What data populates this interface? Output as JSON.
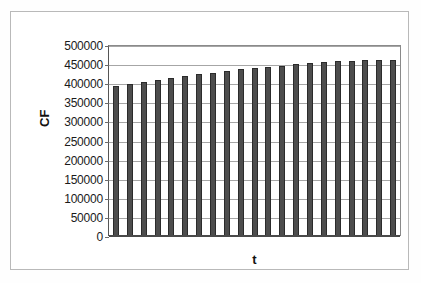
{
  "chart_data": {
    "type": "bar",
    "title": "",
    "xlabel": "t",
    "ylabel": "CF",
    "ylim": [
      0,
      500000
    ],
    "ytick_labels": [
      "500000",
      "450000",
      "400000",
      "350000",
      "300000",
      "250000",
      "200000",
      "150000",
      "100000",
      "50000",
      "0"
    ],
    "ytick_values": [
      500000,
      450000,
      400000,
      350000,
      300000,
      250000,
      200000,
      150000,
      100000,
      50000,
      0
    ],
    "xtick_labels": [],
    "grid": true,
    "legend": false,
    "bar_color": "#4d4d4d",
    "bar_edge_color": "#2b2b2b",
    "categories": [
      "1",
      "2",
      "3",
      "4",
      "5",
      "6",
      "7",
      "8",
      "9",
      "10",
      "11",
      "12",
      "13",
      "14",
      "15",
      "16",
      "17",
      "18",
      "19",
      "20",
      "21"
    ],
    "values": [
      392000,
      398000,
      403000,
      408000,
      414000,
      418000,
      423000,
      427000,
      432000,
      437000,
      441000,
      443000,
      446000,
      450000,
      453000,
      455000,
      457000,
      458000,
      461000,
      461000,
      462000
    ]
  },
  "figure": {
    "background": "#ffffff",
    "frame_color": "#b9b9b9",
    "gridline_color": "#a6a6a6",
    "axis_color": "#4a4a4a"
  }
}
